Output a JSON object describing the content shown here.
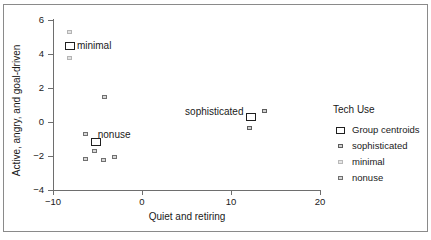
{
  "chart_data": {
    "type": "scatter",
    "title": "",
    "xlabel": "Quiet and retiring",
    "ylabel": "Active, angry, and goal-driven",
    "xlim": [
      -10,
      20
    ],
    "ylim": [
      -4,
      6
    ],
    "xticks": [
      "−10",
      "0",
      "10",
      "20"
    ],
    "yticks": [
      "6",
      "4",
      "2",
      "0",
      "−2",
      "−4"
    ],
    "xtick_values": [
      -10,
      0,
      10,
      20
    ],
    "ytick_values": [
      6,
      4,
      2,
      0,
      -2,
      -4
    ],
    "grid": false,
    "legend_position": "right",
    "series": [
      {
        "name": "sophisticated",
        "color": "#d2d2d2",
        "edge_color": "#5d5d5d",
        "points": [
          {
            "x": 13.8,
            "y": 0.65
          },
          {
            "x": 12.5,
            "y": 0.3
          },
          {
            "x": 12.1,
            "y": -0.35
          }
        ]
      },
      {
        "name": "minimal",
        "color": "#e6e6e6",
        "edge_color": "#b9b9b9",
        "points": [
          {
            "x": -8.1,
            "y": 5.3
          },
          {
            "x": -8.1,
            "y": 3.75
          }
        ]
      },
      {
        "name": "nonuse",
        "color": "#d8d8d8",
        "edge_color": "#707070",
        "points": [
          {
            "x": -4.2,
            "y": 1.5
          },
          {
            "x": -6.35,
            "y": -0.7
          },
          {
            "x": -5.35,
            "y": -1.7
          },
          {
            "x": -6.4,
            "y": -2.2
          },
          {
            "x": -4.35,
            "y": -2.25
          },
          {
            "x": -3.1,
            "y": -2.05
          }
        ]
      }
    ],
    "centroids": [
      {
        "label": "minimal",
        "x": -8.1,
        "y": 4.5,
        "label_offset": "right"
      },
      {
        "label": "nonuse",
        "x": -5.2,
        "y": -1.2,
        "label_offset": "upper-right"
      },
      {
        "label": "sophisticated",
        "x": 12.3,
        "y": 0.3,
        "label_offset": "left"
      }
    ]
  },
  "legend": {
    "title": "Tech Use",
    "items": [
      {
        "label": "Group centroids",
        "key": "centroid-swatch"
      },
      {
        "label": "sophisticated",
        "key": "sophisticated-swatch"
      },
      {
        "label": "minimal",
        "key": "minimal-swatch"
      },
      {
        "label": "nonuse",
        "key": "nonuse-swatch"
      }
    ]
  }
}
